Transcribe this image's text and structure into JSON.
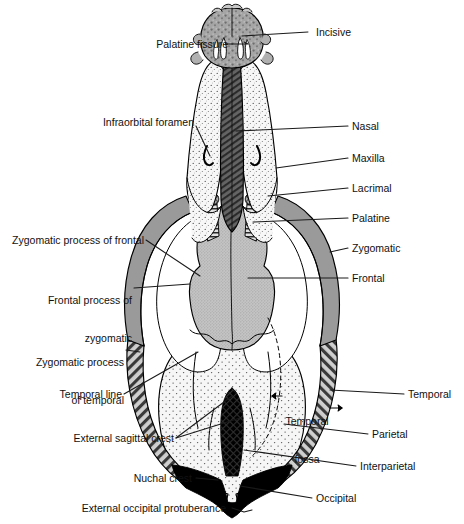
{
  "figure": {
    "view": "dorsal",
    "background_color": "#ffffff",
    "line_color": "#000000"
  },
  "palette": {
    "incisive_fill": "#9d9d9d",
    "maxilla_fill": "#f4f4f4",
    "nasal_fill": "#575757",
    "frontal_fill": "#b5b5b5",
    "zygomatic_fill": "#9a9a9a",
    "palatine_fill": "#cfcfcf",
    "lacrimal_fill": "#a8a8a8",
    "parietal_fill": "#f2f2f2",
    "temporal_fill": "#8f8f8f",
    "interparietal_fill": "#111111",
    "occipital_fill": "#000000",
    "fossa_white": "#ffffff"
  },
  "labels": {
    "incisive": "Incisive",
    "palatine_fissure": "Palatine fissure",
    "infraorbital_foramen": "Infraorbital foramen",
    "nasal": "Nasal",
    "maxilla": "Maxilla",
    "lacrimal": "Lacrimal",
    "palatine": "Palatine",
    "zygomatic": "Zygomatic",
    "frontal": "Frontal",
    "zygomatic_process_of_frontal": "Zygomatic process of frontal",
    "frontal_process_of_zygomatic_line1": "Frontal process of",
    "frontal_process_of_zygomatic_line2": "zygomatic",
    "zygomatic_process_of_temporal_line1": "Zygomatic process",
    "zygomatic_process_of_temporal_line2": "of temporal",
    "temporal_line": "Temporal line",
    "temporal": "Temporal",
    "external_sagittal_crest": "External sagittal crest",
    "parietal": "Parietal",
    "temporal_fossa_line1": "Temporal",
    "temporal_fossa_line2": "fossa",
    "temporal_fossa_arrow_left": "←",
    "temporal_fossa_arrow_right": "→",
    "interparietal": "Interparietal",
    "nuchal_crest": "Nuchal crest",
    "occipital": "Occipital",
    "external_occipital_protuberance": "External occipital protuberance"
  },
  "structures": [
    {
      "key": "incisive",
      "name": "Incisive bone",
      "side": "paired",
      "texture": "coarse-stipple"
    },
    {
      "key": "maxilla",
      "name": "Maxilla",
      "side": "paired",
      "texture": "fine-stipple"
    },
    {
      "key": "nasal",
      "name": "Nasal bone",
      "side": "paired",
      "texture": "diagonal-hatch-dark"
    },
    {
      "key": "lacrimal",
      "name": "Lacrimal",
      "side": "paired",
      "texture": "cross-hatch"
    },
    {
      "key": "palatine",
      "name": "Palatine",
      "side": "paired",
      "texture": "horizontal-hatch"
    },
    {
      "key": "zygomatic",
      "name": "Zygomatic",
      "side": "paired",
      "texture": "solid-gray"
    },
    {
      "key": "frontal",
      "name": "Frontal",
      "side": "paired",
      "texture": "fine-dot-gray"
    },
    {
      "key": "parietal",
      "name": "Parietal",
      "side": "paired",
      "texture": "dot-grid"
    },
    {
      "key": "temporal",
      "name": "Temporal",
      "side": "paired",
      "texture": "diagonal-hatch"
    },
    {
      "key": "interparietal",
      "name": "Interparietal",
      "side": "single",
      "texture": "black-diamond"
    },
    {
      "key": "occipital",
      "name": "Occipital",
      "side": "single",
      "texture": "solid-black"
    }
  ]
}
